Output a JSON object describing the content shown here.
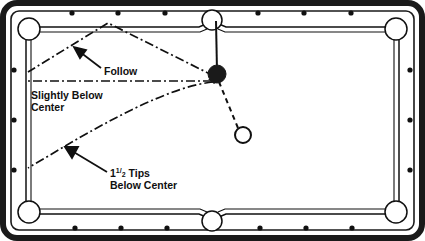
{
  "diagram": {
    "type": "billiards-shot-diagram",
    "colors": {
      "table_outer_frame": "#1a1a1a",
      "rail_fill": "#ffffff",
      "cloth_fill": "#ffffff",
      "line_stroke": "#101010",
      "object_ball_fill": "#1a1a1a",
      "cue_ball_fill": "#ffffff",
      "text": "#101010"
    },
    "labels": [
      {
        "id": "follow",
        "text": "Follow",
        "x": 104,
        "y": 71,
        "anchor": "start",
        "arrow_from": [
          100,
          68
        ],
        "arrow_to": [
          77,
          50
        ]
      },
      {
        "id": "slightly-below-center",
        "line1": "Slightly Below",
        "line2": "Center",
        "x": 31,
        "y": 97,
        "anchor": "start"
      },
      {
        "id": "one-and-half-tips-below-center",
        "whole": "1",
        "numerator": "1",
        "denominator": "2",
        "word": " Tips",
        "line2": "Below Center",
        "x": 110,
        "y": 177,
        "anchor": "start",
        "arrow_from": [
          106,
          172
        ],
        "arrow_to": [
          66,
          148
        ]
      }
    ],
    "balls": [
      {
        "id": "object-ball",
        "kind": "object-ball",
        "cx": 217,
        "cy": 74,
        "r": 9,
        "filled": true
      },
      {
        "id": "cue-ball",
        "kind": "cue-ball",
        "cx": 243,
        "cy": 135,
        "r": 8,
        "filled": false
      }
    ],
    "cue_line": {
      "id": "cue-stick-line",
      "from": [
        216,
        20
      ],
      "to": [
        217,
        70
      ]
    },
    "aim_line": {
      "id": "cue-ball-contact-line",
      "from": [
        238,
        128
      ],
      "to": [
        219,
        81
      ],
      "style": "dashed"
    },
    "paths": [
      {
        "id": "follow-path",
        "label": "Follow",
        "style": "dash-dot",
        "points": [
          [
            216,
            76
          ],
          [
            108,
            23
          ],
          [
            28,
            72
          ]
        ]
      },
      {
        "id": "slightly-below-center-path",
        "label": "Slightly Below Center",
        "style": "dash-dot",
        "points": [
          [
            213,
            81
          ],
          [
            28,
            81
          ]
        ]
      },
      {
        "id": "one-half-tips-path",
        "label": "1 1/2 Tips Below Center",
        "style": "dash-dot",
        "curve": "M 214 82 C 170 86, 110 120, 70 143 L 28 168"
      }
    ],
    "table": {
      "outer_rect": {
        "x": 3,
        "y": 3,
        "w": 419,
        "h": 235,
        "rx": 14
      },
      "rail_rect": {
        "x": 11,
        "y": 11,
        "w": 403,
        "h": 219,
        "rx": 8
      },
      "cloth_rect": {
        "x": 24,
        "y": 24,
        "w": 377,
        "h": 193
      },
      "pockets": [
        {
          "id": "pocket-top-left",
          "cx": 28,
          "cy": 28,
          "r": 11
        },
        {
          "id": "pocket-top-middle",
          "cx": 212,
          "cy": 19,
          "r": 10
        },
        {
          "id": "pocket-top-right",
          "cx": 397,
          "cy": 28,
          "r": 11
        },
        {
          "id": "pocket-bottom-left",
          "cx": 28,
          "cy": 213,
          "r": 11
        },
        {
          "id": "pocket-bottom-middle",
          "cx": 212,
          "cy": 222,
          "r": 10
        },
        {
          "id": "pocket-bottom-right",
          "cx": 397,
          "cy": 213,
          "r": 11
        }
      ],
      "diamonds_top": [
        {
          "cx": 72,
          "cy": 13
        },
        {
          "cx": 118,
          "cy": 13
        },
        {
          "cx": 165,
          "cy": 13
        },
        {
          "cx": 258,
          "cy": 13
        },
        {
          "cx": 304,
          "cy": 13
        },
        {
          "cx": 351,
          "cy": 13
        }
      ],
      "diamonds_bottom": [
        {
          "cx": 75,
          "cy": 228
        },
        {
          "cx": 121,
          "cy": 228
        },
        {
          "cx": 167,
          "cy": 228
        },
        {
          "cx": 260,
          "cy": 228
        },
        {
          "cx": 306,
          "cy": 228
        },
        {
          "cx": 352,
          "cy": 228
        }
      ],
      "diamonds_left": [
        {
          "cx": 14,
          "cy": 70
        },
        {
          "cx": 14,
          "cy": 120
        },
        {
          "cx": 14,
          "cy": 170
        }
      ],
      "diamonds_right": [
        {
          "cx": 410,
          "cy": 70
        },
        {
          "cx": 410,
          "cy": 120
        },
        {
          "cx": 410,
          "cy": 170
        }
      ],
      "diamond_radius": 2.6
    }
  }
}
